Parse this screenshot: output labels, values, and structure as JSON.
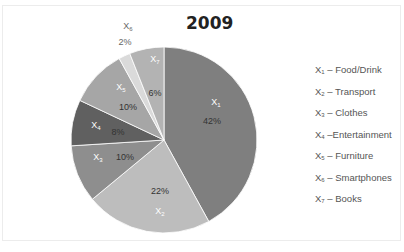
{
  "chart_data": {
    "type": "pie",
    "title": "2009",
    "categories": [
      "X1 – Food/Drink",
      "X2 – Transport",
      "X3 – Clothes",
      "X4 –Entertainment",
      "X5 – Furniture",
      "X6 – Smartphones",
      "X7 – Books"
    ],
    "series": [
      {
        "name": "2009",
        "values": [
          42,
          22,
          10,
          8,
          10,
          2,
          6
        ]
      }
    ],
    "slice_labels": [
      "X1",
      "X2",
      "X3",
      "X4",
      "X5",
      "X6",
      "X7"
    ],
    "percent_labels": [
      "42%",
      "22%",
      "10%",
      "8%",
      "10%",
      "2%",
      "6%"
    ],
    "colors": [
      "#7f7f7f",
      "#bdbdbd",
      "#8e8e8e",
      "#606060",
      "#a6a6a6",
      "#dadada",
      "#b3b3b3"
    ],
    "legend_position": "right",
    "start_angle": "12 o'clock, clockwise"
  },
  "title": "2009",
  "legend": [
    {
      "key": "X",
      "sub": "1",
      "text": " – Food/Drink"
    },
    {
      "key": "X",
      "sub": "2",
      "text": " – Transport"
    },
    {
      "key": "X",
      "sub": "3",
      "text": " – Clothes"
    },
    {
      "key": "X",
      "sub": "4",
      "text": " –Entertainment"
    },
    {
      "key": "X",
      "sub": "5",
      "text": " – Furniture"
    },
    {
      "key": "X",
      "sub": "6",
      "text": " – Smartphones"
    },
    {
      "key": "X",
      "sub": "7",
      "text": " – Books"
    }
  ]
}
